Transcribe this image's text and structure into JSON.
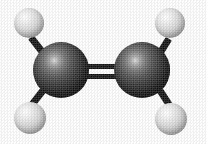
{
  "figure": {
    "molecule_name": "Ethylene",
    "formula": "C2H4",
    "representation": "ball-and-stick",
    "background_color": "#fefefe",
    "width": 206,
    "height": 144,
    "rendering_style": "halftone scanned print, grayscale"
  },
  "legend": {
    "carbon_color": "#1a1a1a",
    "carbon_label": "Carbon",
    "hydrogen_color": "#d2d2d2",
    "hydrogen_label": "Hydrogen",
    "bond_color": "#0a0a0a"
  },
  "atoms": [
    {
      "id": "carbon-left",
      "element": "C",
      "label": "Carbon (left)",
      "cx": 61,
      "cy": 70,
      "r": 28,
      "color": "#1a1a1a",
      "highlight": "38% 33%"
    },
    {
      "id": "carbon-right",
      "element": "C",
      "label": "Carbon (right)",
      "cx": 142,
      "cy": 70,
      "r": 28,
      "color": "#1a1a1a",
      "highlight": "38% 33%"
    },
    {
      "id": "hydrogen-top-left",
      "element": "H",
      "label": "Hydrogen (top left)",
      "cx": 29,
      "cy": 23,
      "r": 15,
      "color": "#d2d2d2",
      "highlight": "36% 31%"
    },
    {
      "id": "hydrogen-top-right",
      "element": "H",
      "label": "Hydrogen (top right)",
      "cx": 170,
      "cy": 23,
      "r": 15,
      "color": "#d2d2d2",
      "highlight": "36% 31%"
    },
    {
      "id": "hydrogen-bottom-left",
      "element": "H",
      "label": "Hydrogen (bottom left)",
      "cx": 30,
      "cy": 118,
      "r": 16,
      "color": "#d2d2d2",
      "highlight": "36% 31%"
    },
    {
      "id": "hydrogen-bottom-right",
      "element": "H",
      "label": "Hydrogen (bottom right)",
      "cx": 171,
      "cy": 119,
      "r": 16,
      "color": "#d2d2d2",
      "highlight": "36% 31%"
    }
  ],
  "bonds": [
    {
      "id": "bond-c-c",
      "label": "Carbon-carbon double bond",
      "from": "carbon-left",
      "to": "carbon-right",
      "order": 2,
      "type": "double",
      "bar_top_y": 64,
      "bar_bottom_y": 74,
      "bar_thickness": 5,
      "x_start": 84,
      "x_end": 120,
      "color": "#0d0d0d"
    },
    {
      "id": "bond-c-h-top-left",
      "label": "Carbon-hydrogen bond (top left)",
      "from": "carbon-left",
      "to": "hydrogen-top-left",
      "order": 1,
      "type": "single",
      "x1": 42,
      "y1": 51,
      "x2": 31,
      "y2": 37,
      "thickness": 7,
      "color": "#0a0a0a"
    },
    {
      "id": "bond-c-h-bottom-left",
      "label": "Carbon-hydrogen bond (bottom left)",
      "from": "carbon-left",
      "to": "hydrogen-bottom-left",
      "order": 1,
      "type": "single",
      "x1": 43,
      "y1": 90,
      "x2": 32,
      "y2": 104,
      "thickness": 7,
      "color": "#0a0a0a"
    },
    {
      "id": "bond-c-h-top-right",
      "label": "Carbon-hydrogen bond (top right)",
      "from": "carbon-right",
      "to": "hydrogen-top-right",
      "order": 1,
      "type": "single",
      "x1": 161,
      "y1": 51,
      "x2": 169,
      "y2": 38,
      "thickness": 7,
      "color": "#0a0a0a"
    },
    {
      "id": "bond-c-h-bottom-right",
      "label": "Carbon-hydrogen bond (bottom right)",
      "from": "carbon-right",
      "to": "hydrogen-bottom-right",
      "order": 1,
      "type": "single",
      "x1": 160,
      "y1": 90,
      "x2": 169,
      "y2": 104,
      "thickness": 7,
      "color": "#0a0a0a"
    }
  ]
}
